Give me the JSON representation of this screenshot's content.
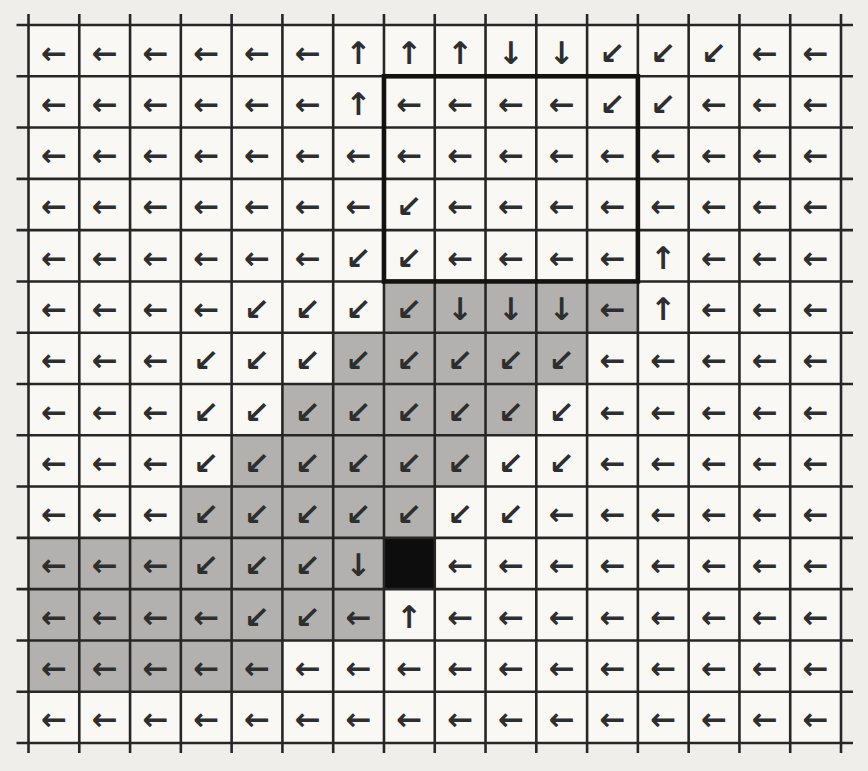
{
  "figure": {
    "rows": 14,
    "cols": 16,
    "policy": [
      "LLLLLLUUUDDKKKLL",
      "LLLLLLULLLLKKLLL",
      "LLLLLLLLLLLLLLLL",
      "LLLLLLLKLLLLLLLL",
      "LLLLLLKKLLLLULLL",
      "LLLLKKKKDDDLULLL",
      "LLLKKKKKKKKLLLLL",
      "LLLKKKKKKKKLLLLL",
      "LLLKKKKKKKKLLLLL",
      "LLLKKKKKKKLLLLLL",
      "LLLKKKDBLLLLLLLL",
      "LLLLKKLULLLLLLLL",
      "LLLLLLLLLLLLLLLL",
      "LLLLLLLLLLLLLLLL"
    ],
    "shading": [
      "................",
      "................",
      "................",
      "................",
      "................",
      ".......GGGGG....",
      "......GGGGG.....",
      ".....GGGGG......",
      "....GGGGG.......",
      "...GGGGG........",
      "GGGGGGGB........",
      "GGGGGGG.........",
      "GGGGG...........",
      "................"
    ],
    "goal_cell": {
      "row": 11,
      "col": 8
    },
    "highlight_box": {
      "row_start": 2,
      "col_start": 8,
      "row_end": 5,
      "col_end": 12
    }
  },
  "arrows": {
    "L": {
      "name": "arrow-left-icon",
      "glyph": "←"
    },
    "U": {
      "name": "arrow-up-icon",
      "glyph": "↑"
    },
    "D": {
      "name": "arrow-down-icon",
      "glyph": "↓"
    },
    "K": {
      "name": "arrow-down-left-icon",
      "glyph": "↙"
    },
    "B": {
      "name": "goal-cell",
      "glyph": ""
    }
  },
  "colors": {
    "page_bg": "#efeeea",
    "cell_bg": "#f9f8f5",
    "gray_cell": "#b2b1af",
    "black_cell": "#0d0d0d",
    "grid_line": "#262626",
    "box_border": "#121212",
    "arrow": "#2e2e2e"
  }
}
